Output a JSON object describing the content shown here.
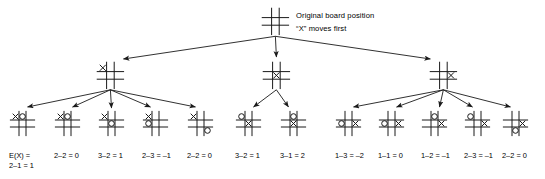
{
  "diagram": {
    "annotation": {
      "line1": "Original board position",
      "line2": "“X” moves first"
    },
    "eval_prefix": "E(X) =",
    "colors": {
      "stroke": "#1a1a1a",
      "text": "#000000",
      "background": "#ffffff"
    }
  },
  "root": {
    "name": "root-board",
    "cells": [
      "",
      "",
      "",
      "",
      "",
      "",
      "",
      "",
      ""
    ]
  },
  "level2": [
    {
      "name": "board-x-corner",
      "cells": [
        "X",
        "",
        "",
        "",
        "",
        "",
        "",
        "",
        ""
      ]
    },
    {
      "name": "board-x-center",
      "cells": [
        "",
        "",
        "",
        "",
        "X",
        "",
        "",
        "",
        ""
      ]
    },
    {
      "name": "board-x-edge",
      "cells": [
        "",
        "",
        "",
        "",
        "",
        "X",
        "",
        "",
        ""
      ]
    }
  ],
  "level3": [
    {
      "name": "leaf-1",
      "group": "left",
      "cells": [
        "X",
        "O",
        "",
        "",
        "",
        "",
        "",
        "",
        ""
      ],
      "label": "2–1 = 1",
      "label_top": "E(X) ="
    },
    {
      "name": "leaf-2",
      "group": "left",
      "cells": [
        "X",
        "O",
        "",
        "",
        "",
        "",
        "",
        "",
        ""
      ],
      "label": "2–2 = 0"
    },
    {
      "name": "leaf-3",
      "group": "left",
      "cells": [
        "X",
        "",
        "",
        "",
        "O",
        "",
        "",
        "",
        ""
      ],
      "label": "3–2 = 1"
    },
    {
      "name": "leaf-4",
      "group": "left",
      "cells": [
        "X",
        "",
        "",
        "O",
        "",
        "",
        "",
        "",
        ""
      ],
      "label": "2–3 = –1"
    },
    {
      "name": "leaf-5",
      "group": "left",
      "cells": [
        "X",
        "",
        "",
        "",
        "",
        "",
        "",
        "",
        "O"
      ],
      "label": "2–2 = 0"
    },
    {
      "name": "leaf-6",
      "group": "center",
      "cells": [
        "O",
        "",
        "",
        "",
        "X",
        "",
        "",
        "",
        ""
      ],
      "label": "3–2 = 1"
    },
    {
      "name": "leaf-7",
      "group": "center",
      "cells": [
        "",
        "O",
        "",
        "",
        "X",
        "",
        "",
        "",
        ""
      ],
      "label": "3–1 = 2"
    },
    {
      "name": "leaf-8",
      "group": "right",
      "cells": [
        "",
        "",
        "",
        "O",
        "",
        "X",
        "",
        "",
        ""
      ],
      "label": "1–3 = –2"
    },
    {
      "name": "leaf-9",
      "group": "right",
      "cells": [
        "",
        "",
        "",
        "O",
        "",
        "X",
        "",
        "",
        ""
      ],
      "label": "1–1 = 0"
    },
    {
      "name": "leaf-10",
      "group": "right",
      "cells": [
        "",
        "O",
        "",
        "",
        "",
        "X",
        "",
        "",
        ""
      ],
      "label": "1–2 = –1"
    },
    {
      "name": "leaf-11",
      "group": "right",
      "cells": [
        "O",
        "",
        "",
        "",
        "",
        "X",
        "",
        "",
        ""
      ],
      "label": "2–3 = –1"
    },
    {
      "name": "leaf-12",
      "group": "right",
      "cells": [
        "",
        "",
        "",
        "",
        "",
        "X",
        "",
        "O",
        ""
      ],
      "label": "2–2 = 0"
    }
  ]
}
